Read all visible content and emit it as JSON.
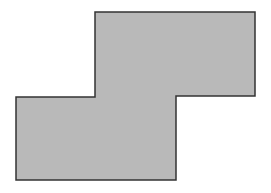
{
  "figure": {
    "type": "polygon",
    "fill_color": "#b9b9b9",
    "stroke_color": "#333333",
    "stroke_width": 1.5,
    "points": [
      [
        95,
        12
      ],
      [
        255,
        12
      ],
      [
        255,
        96
      ],
      [
        176,
        96
      ],
      [
        176,
        180
      ],
      [
        16,
        180
      ],
      [
        16,
        97
      ],
      [
        95,
        97
      ]
    ]
  }
}
